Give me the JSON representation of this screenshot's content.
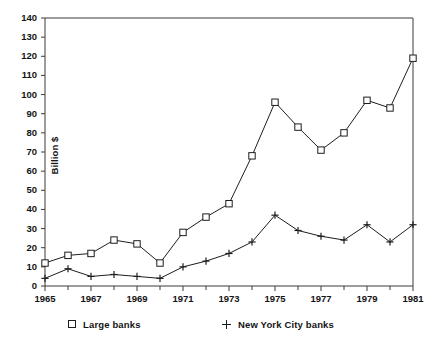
{
  "chart_data": {
    "type": "line",
    "title": "",
    "subtitle": "",
    "xlabel": "",
    "ylabel": "Billion $",
    "xlim": [
      1965,
      1981
    ],
    "ylim": [
      0,
      140
    ],
    "ytick_step": 10,
    "xtick_step": 2,
    "grid": false,
    "legend_position": "bottom",
    "x": [
      1965,
      1966,
      1967,
      1968,
      1969,
      1970,
      1971,
      1972,
      1973,
      1974,
      1975,
      1976,
      1977,
      1978,
      1979,
      1980,
      1981
    ],
    "xtick_labels": [
      "1965",
      "1967",
      "1969",
      "1971",
      "1973",
      "1975",
      "1977",
      "1979",
      "1981"
    ],
    "ytick_labels": [
      "0",
      "10",
      "20",
      "30",
      "40",
      "50",
      "60",
      "70",
      "80",
      "90",
      "100",
      "110",
      "120",
      "130",
      "140"
    ],
    "series": [
      {
        "name": "Large banks",
        "marker": "square",
        "values": [
          12,
          16,
          17,
          24,
          22,
          12,
          28,
          36,
          43,
          68,
          96,
          83,
          71,
          80,
          97,
          93,
          119
        ]
      },
      {
        "name": "New York City banks",
        "marker": "plus",
        "values": [
          4,
          9,
          5,
          6,
          5,
          4,
          10,
          13,
          17,
          23,
          37,
          29,
          26,
          24,
          32,
          23,
          32
        ]
      }
    ]
  },
  "axis": {
    "ylabel": "Billion $",
    "yticks": [
      "140",
      "130",
      "120",
      "110",
      "100",
      "90",
      "80",
      "70",
      "60",
      "50",
      "40",
      "30",
      "20",
      "10",
      "0"
    ],
    "xticks": [
      "1965",
      "1967",
      "1969",
      "1971",
      "1973",
      "1975",
      "1977",
      "1979",
      "1981"
    ]
  },
  "legend": {
    "entries": [
      {
        "label": "Large banks",
        "marker": "square-marker"
      },
      {
        "label": "New York City banks",
        "marker": "plus-marker"
      }
    ]
  }
}
